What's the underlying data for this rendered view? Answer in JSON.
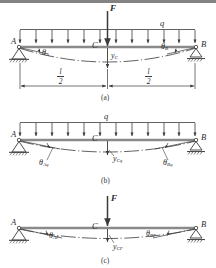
{
  "figure": {
    "stroke_color": "#3a3a3a",
    "beam_color": "#8a8a8a",
    "background": "#ffffff"
  },
  "panels": [
    {
      "id": "a",
      "caption": "(a)",
      "description": "Simply supported beam with concentrated force F at midspan and uniformly distributed load q",
      "loads": [
        {
          "name": "concentrated-force",
          "label": "F"
        },
        {
          "name": "distributed-load",
          "label": "q"
        }
      ],
      "supports": [
        {
          "name": "pin-support",
          "label": "A"
        },
        {
          "name": "roller-support",
          "label": "B"
        }
      ],
      "midpoint_label": "C",
      "angles": [
        {
          "name": "slope-angle-a",
          "symbol": "θ",
          "sub": "A"
        },
        {
          "name": "slope-angle-b",
          "symbol": "θ",
          "sub": "B"
        }
      ],
      "deflection": {
        "name": "midspan-deflection",
        "symbol": "y",
        "sub": "C"
      },
      "dimensions": [
        {
          "numerator": "l",
          "denominator": "2"
        },
        {
          "numerator": "l",
          "denominator": "2"
        }
      ]
    },
    {
      "id": "b",
      "caption": "(b)",
      "description": "Same beam carrying only the uniformly distributed load q",
      "loads": [
        {
          "name": "distributed-load",
          "label": "q"
        }
      ],
      "supports": [
        {
          "name": "pin-support",
          "label": "A"
        },
        {
          "name": "roller-support",
          "label": "B"
        }
      ],
      "midpoint_label": "C",
      "angles": [
        {
          "name": "slope-angle-aq",
          "symbol": "θ",
          "sub": "Aq"
        },
        {
          "name": "slope-angle-bq",
          "symbol": "θ",
          "sub": "Bq"
        }
      ],
      "deflection": {
        "name": "midspan-deflection-q",
        "symbol": "y",
        "sub": "Cq"
      }
    },
    {
      "id": "c",
      "caption": "(c)",
      "description": "Same beam carrying only the concentrated force F at midspan",
      "loads": [
        {
          "name": "concentrated-force",
          "label": "F"
        }
      ],
      "supports": [
        {
          "name": "pin-support",
          "label": "A"
        },
        {
          "name": "roller-support",
          "label": "B"
        }
      ],
      "midpoint_label": "C",
      "angles": [
        {
          "name": "slope-angle-af",
          "symbol": "θ",
          "sub": "AF"
        },
        {
          "name": "slope-angle-bf",
          "symbol": "θ",
          "sub": "BF"
        }
      ],
      "deflection": {
        "name": "midspan-deflection-f",
        "symbol": "y",
        "sub": "CF"
      }
    }
  ]
}
